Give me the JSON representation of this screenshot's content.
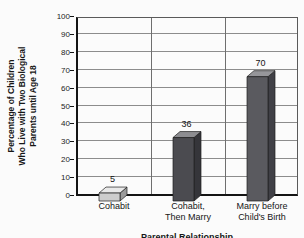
{
  "chart_data": {
    "type": "bar",
    "style": "3d-bars",
    "title": "",
    "ylabel": "Percentage of Children\nWho Live with Two Biological\nParents until Age 18",
    "xlabel": "Parental Relationship",
    "categories": [
      "Cohabit",
      "Cohabit,\nThen Marry",
      "Marry before\nChild's Birth"
    ],
    "values": [
      5,
      36,
      70
    ],
    "bar_value_labels": [
      "5",
      "36",
      "70"
    ],
    "ylim": [
      0,
      100
    ],
    "yticks": [
      0,
      10,
      20,
      30,
      40,
      50,
      60,
      70,
      80,
      90,
      100
    ],
    "grid": true,
    "legend": "none",
    "bar_colors": [
      {
        "front": "#cdcdcd",
        "top": "#e9e9e9",
        "side": "#9a9a9a"
      },
      {
        "front": "#4b4b50",
        "top": "#8d8d91",
        "side": "#35353a"
      },
      {
        "front": "#5a5a5f",
        "top": "#96969a",
        "side": "#404046"
      }
    ],
    "outline_color": "#1f1f1f",
    "gridline_color": "#8c8c8c",
    "axis_color": "#141414",
    "background_color": "#fbfbfb"
  }
}
